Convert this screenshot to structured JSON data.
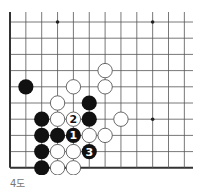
{
  "diagram": {
    "caption": "4도",
    "colors": {
      "line": "#555555",
      "edge": "#333333",
      "black_stone": "#111111",
      "white_stone": "#ffffff",
      "white_outline": "#444444",
      "star": "#222222",
      "caption": "#777777"
    },
    "grid": {
      "columns_visible": 12,
      "rows_visible": 10,
      "left_edge": true,
      "bottom_edge": true
    },
    "star_points": [
      {
        "col": 3,
        "row": 0
      },
      {
        "col": 9,
        "row": 0
      },
      {
        "col": 9,
        "row": 6
      }
    ],
    "stones": [
      {
        "color": "white",
        "col": 6,
        "row": 3,
        "label": ""
      },
      {
        "color": "black",
        "col": 1,
        "row": 4,
        "label": ""
      },
      {
        "color": "white",
        "col": 4,
        "row": 4,
        "label": ""
      },
      {
        "color": "white",
        "col": 6,
        "row": 4,
        "label": ""
      },
      {
        "color": "white",
        "col": 3,
        "row": 5,
        "label": ""
      },
      {
        "color": "black",
        "col": 5,
        "row": 5,
        "label": ""
      },
      {
        "color": "black",
        "col": 2,
        "row": 6,
        "label": ""
      },
      {
        "color": "white",
        "col": 3,
        "row": 6,
        "label": ""
      },
      {
        "color": "white",
        "col": 4,
        "row": 6,
        "label": "2"
      },
      {
        "color": "black",
        "col": 5,
        "row": 6,
        "label": ""
      },
      {
        "color": "white",
        "col": 7,
        "row": 6,
        "label": ""
      },
      {
        "color": "black",
        "col": 2,
        "row": 7,
        "label": ""
      },
      {
        "color": "black",
        "col": 3,
        "row": 7,
        "label": ""
      },
      {
        "color": "black",
        "col": 4,
        "row": 7,
        "label": "1"
      },
      {
        "color": "white",
        "col": 5,
        "row": 7,
        "label": ""
      },
      {
        "color": "white",
        "col": 6,
        "row": 7,
        "label": ""
      },
      {
        "color": "black",
        "col": 2,
        "row": 8,
        "label": ""
      },
      {
        "color": "white",
        "col": 3,
        "row": 8,
        "label": ""
      },
      {
        "color": "white",
        "col": 4,
        "row": 8,
        "label": ""
      },
      {
        "color": "black",
        "col": 5,
        "row": 8,
        "label": "3"
      },
      {
        "color": "black",
        "col": 2,
        "row": 9,
        "label": ""
      },
      {
        "color": "white",
        "col": 3,
        "row": 9,
        "label": ""
      },
      {
        "color": "white",
        "col": 4,
        "row": 9,
        "label": ""
      }
    ]
  }
}
